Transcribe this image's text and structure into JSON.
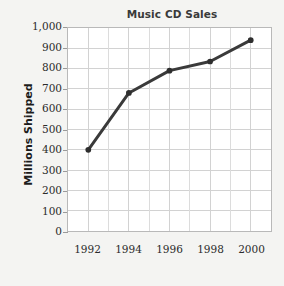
{
  "chart_data": {
    "type": "line",
    "title": "Music CD Sales",
    "xlabel": "",
    "ylabel": "Millions Shipped",
    "x": [
      1992,
      1994,
      1996,
      1998,
      2000
    ],
    "categories": [
      "1992",
      "1994",
      "1996",
      "1998",
      "2000"
    ],
    "values": [
      400,
      680,
      790,
      835,
      940
    ],
    "series": [
      {
        "name": "Millions Shipped",
        "values": [
          400,
          680,
          790,
          835,
          940
        ]
      }
    ],
    "ylim": [
      0,
      1000
    ],
    "ytick_step": 100,
    "ytick_labels": [
      "1,000",
      "900",
      "800",
      "700",
      "600",
      "500",
      "400",
      "300",
      "200",
      "100",
      "0"
    ],
    "ytick_values": [
      1000,
      900,
      800,
      700,
      600,
      500,
      400,
      300,
      200,
      100,
      0
    ],
    "xlim": [
      1991,
      2001
    ],
    "xtick_labels": [
      "1992",
      "1994",
      "1996",
      "1998",
      "2000"
    ],
    "grid": true,
    "grid_minor_vertical": true,
    "legend": false,
    "legend_position": "none",
    "marker": "circle",
    "colors": {
      "line": "#3a3a3a",
      "marker": "#2e2e2e",
      "grid": "#d2d2d2",
      "grid_minor": "#dcdcdc",
      "frame": "#b9b9b9",
      "title_text": "#3a3a3a",
      "axis_text": "#2b2b2b",
      "axis_title_text": "#1c1c1c",
      "plot_background": "#ffffff",
      "page_background": "#f4f4f2"
    }
  }
}
